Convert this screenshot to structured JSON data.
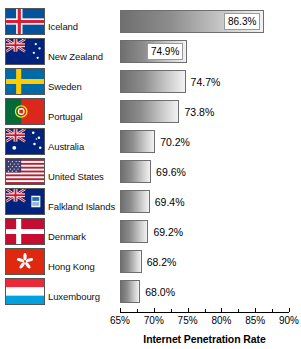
{
  "chart_data": {
    "type": "bar",
    "orientation": "horizontal",
    "title": "",
    "xlabel": "Internet Penetration Rate",
    "ylabel": "",
    "xlim": [
      65,
      90
    ],
    "xtick_labels": [
      "65%",
      "70%",
      "75%",
      "80%",
      "85%",
      "90%"
    ],
    "xticks": [
      65,
      70,
      75,
      80,
      85,
      90
    ],
    "grid": false,
    "legend": null,
    "categories": [
      "Iceland",
      "New Zealand",
      "Sweden",
      "Portugal",
      "Australia",
      "United States",
      "Falkland Islands",
      "Denmark",
      "Hong Kong",
      "Luxembourg"
    ],
    "values": [
      86.3,
      74.9,
      74.7,
      73.8,
      70.2,
      69.6,
      69.4,
      69.2,
      68.2,
      68.0
    ],
    "value_labels": [
      "86.3%",
      "74.9%",
      "74.7%",
      "73.8%",
      "70.2%",
      "69.6%",
      "69.4%",
      "69.2%",
      "68.2%",
      "68.0%"
    ]
  },
  "rows": [
    {
      "country": "Iceland",
      "value": 86.3,
      "label": "86.3%",
      "flag": "flag-iceland",
      "label_position": "inside"
    },
    {
      "country": "New Zealand",
      "value": 74.9,
      "label": "74.9%",
      "flag": "flag-new-zealand",
      "label_position": "inside"
    },
    {
      "country": "Sweden",
      "value": 74.7,
      "label": "74.7%",
      "flag": "flag-sweden",
      "label_position": "outside"
    },
    {
      "country": "Portugal",
      "value": 73.8,
      "label": "73.8%",
      "flag": "flag-portugal",
      "label_position": "outside"
    },
    {
      "country": "Australia",
      "value": 70.2,
      "label": "70.2%",
      "flag": "flag-australia",
      "label_position": "outside"
    },
    {
      "country": "United States",
      "value": 69.6,
      "label": "69.6%",
      "flag": "flag-united-states",
      "label_position": "outside"
    },
    {
      "country": "Falkland Islands",
      "value": 69.4,
      "label": "69.4%",
      "flag": "flag-falkland-islands",
      "label_position": "outside"
    },
    {
      "country": "Denmark",
      "value": 69.2,
      "label": "69.2%",
      "flag": "flag-denmark",
      "label_position": "outside"
    },
    {
      "country": "Hong Kong",
      "value": 68.2,
      "label": "68.2%",
      "flag": "flag-hong-kong",
      "label_position": "outside"
    },
    {
      "country": "Luxembourg",
      "value": 68.0,
      "label": "68.0%",
      "flag": "flag-luxembourg",
      "label_position": "outside"
    }
  ],
  "axis": {
    "title": "Internet Penetration Rate",
    "min": 65,
    "max": 90,
    "ticks": [
      "65%",
      "70%",
      "75%",
      "80%",
      "85%",
      "90%"
    ]
  },
  "colors": {
    "bar_gradient_start": "#6f6f6f",
    "bar_gradient_end": "#f2f2f2",
    "bar_border": "#6e6e6e",
    "axis": "#000000",
    "text": "#000000",
    "background": "#ffffff"
  }
}
